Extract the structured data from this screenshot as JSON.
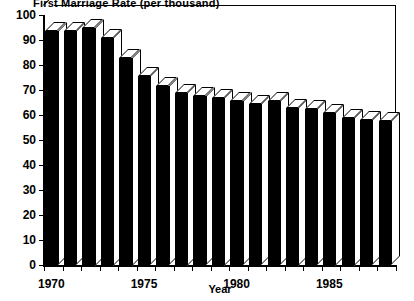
{
  "chart_data": {
    "type": "bar",
    "title": "First Marriage Rate (per thousand)",
    "xlabel": "Year",
    "ylabel": "",
    "ylim": [
      0,
      100
    ],
    "ytick_step": 10,
    "grid": false,
    "legend": null,
    "style": "3d-black-bars",
    "categories": [
      "1970",
      "1971",
      "1972",
      "1973",
      "1974",
      "1975",
      "1976",
      "1977",
      "1978",
      "1979",
      "1980",
      "1981",
      "1982",
      "1983",
      "1984",
      "1985",
      "1986",
      "1987",
      "1988"
    ],
    "values": [
      93.5,
      93.5,
      95.0,
      91.0,
      83.0,
      75.5,
      71.5,
      69.0,
      67.5,
      67.0,
      65.5,
      64.5,
      65.5,
      63.0,
      62.5,
      61.0,
      59.0,
      58.0,
      57.5
    ],
    "yticks": [
      "0",
      "10",
      "20",
      "30",
      "40",
      "50",
      "60",
      "70",
      "80",
      "90",
      "100"
    ],
    "ytick_values": [
      0,
      10,
      20,
      30,
      40,
      50,
      60,
      70,
      80,
      90,
      100
    ],
    "xticks_labeled": [
      "1970",
      "1975",
      "1980",
      "1985"
    ],
    "xtick_label_values": [
      1970,
      1975,
      1980,
      1985
    ]
  },
  "colors": {
    "bar_face": "#000000",
    "bar_highlight": "#ffffff",
    "axis": "#000000",
    "background": "#ffffff"
  }
}
